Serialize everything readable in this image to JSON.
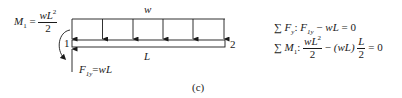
{
  "diagram": {
    "type": "free-body-diagram",
    "caption": "(c)",
    "load_label": "w",
    "length_label": "L",
    "node_left_label": "1",
    "node_right_label": "2",
    "moment_label": {
      "lhs": "M",
      "lhs_sub": "1",
      "equals": "=",
      "numerator": "wL",
      "numerator_sup": "2",
      "denominator": "2"
    },
    "reaction_label": {
      "lhs": "F",
      "lhs_sub": "1y",
      "equals": "=",
      "rhs": "wL"
    },
    "load_arrow_count": 6,
    "colors": {
      "line": "#1a1a1a",
      "background": "#ffffff"
    }
  },
  "equations": [
    {
      "sigma": "∑",
      "var": "F",
      "var_sub": "y",
      "colon": ":",
      "term1": "F",
      "term1_sub": "1y",
      "op": "−",
      "term2": "wL",
      "eq": "= 0"
    },
    {
      "sigma": "∑",
      "var": "M",
      "var_sub": "1",
      "colon": ":",
      "frac1_num": "wL",
      "frac1_num_sup": "2",
      "frac1_den": "2",
      "op": "−",
      "paren": "(wL)",
      "frac2_num": "L",
      "frac2_den": "2",
      "eq": "= 0"
    }
  ]
}
